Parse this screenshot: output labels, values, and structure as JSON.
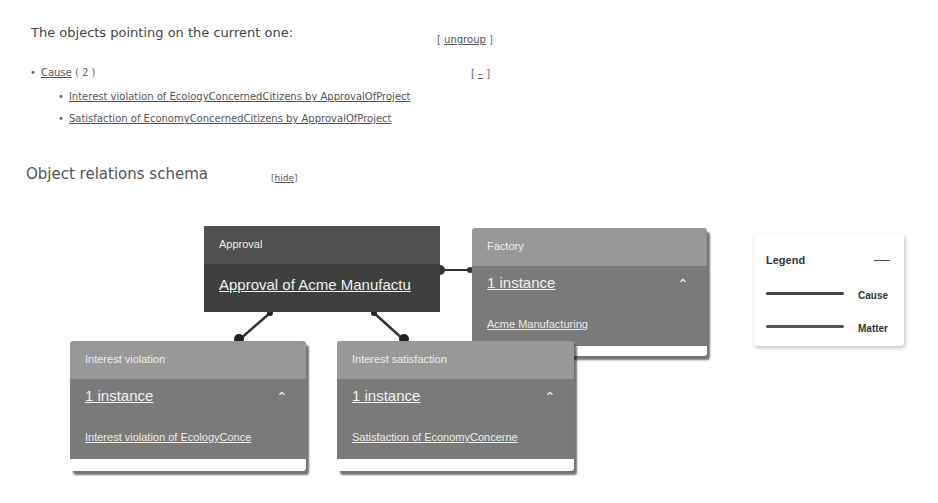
{
  "refs": {
    "title": "The objects pointing on the current one:",
    "ungroup_prefix": "[ ",
    "ungroup_label": "ungroup",
    "ungroup_suffix": " ]",
    "group": {
      "bullet": "•",
      "label": "Cause",
      "count": "( 2 )",
      "collapse_prefix": "[ ",
      "collapse_label": "–",
      "collapse_suffix": " ]",
      "items": [
        {
          "bullet": "•",
          "label": "Interest violation of EcologyConcernedCitizens by ApprovalOfProject"
        },
        {
          "bullet": "•",
          "label": "Satisfaction of EconomyConcernedCitizens by ApprovalOfProject"
        }
      ]
    }
  },
  "schema": {
    "title": "Object relations schema",
    "hide_prefix": "[",
    "hide_label": "hide",
    "hide_suffix": "]",
    "nodes": {
      "approval": {
        "type": "Approval",
        "value": "Approval of Acme Manufactu"
      },
      "factory": {
        "type": "Factory",
        "count": "1 instance",
        "chevron": "^",
        "item": "Acme Manufacturing"
      },
      "violation": {
        "type": "Interest violation",
        "count": "1 instance",
        "chevron": "^",
        "item": "Interest violation of EcologyConce"
      },
      "satisfaction": {
        "type": "Interest satisfaction",
        "count": "1 instance",
        "chevron": "^",
        "item": "Satisfaction of EconomyConcerne"
      }
    },
    "legend": {
      "title": "Legend",
      "entries": [
        {
          "label": "Cause",
          "color": "#444444"
        },
        {
          "label": "Matter",
          "color": "#555555"
        }
      ]
    }
  }
}
